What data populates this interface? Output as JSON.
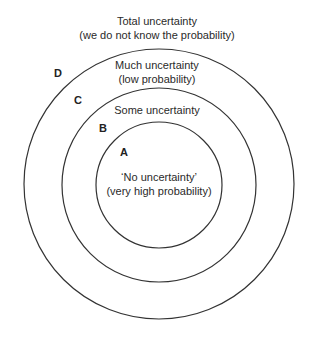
{
  "diagram": {
    "circles": [
      {
        "id": "D",
        "region_label": "Total uncertainty",
        "region_sub": "(we do not know the probability)"
      },
      {
        "id": "C",
        "region_label": "Much uncertainty",
        "region_sub": "(low probability)"
      },
      {
        "id": "B",
        "region_label": "Some uncertainty",
        "region_sub": ""
      },
      {
        "id": "A",
        "region_label": "‘No uncertainty’",
        "region_sub": "(very high probability)"
      }
    ],
    "stroke_color": "#333333",
    "background": "#ffffff"
  }
}
